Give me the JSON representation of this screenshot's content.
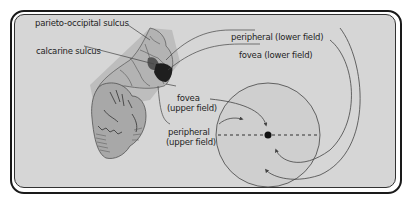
{
  "diagram": {
    "type": "anatomy-visual-field-mapping",
    "labels": {
      "parieto_occipital": "parieto-occipital sulcus",
      "calcarine": "calcarine sulcus",
      "peripheral_lower": "peripheral (lower field)",
      "fovea_lower": "fovea (lower field)",
      "fovea_upper_1": "fovea",
      "fovea_upper_2": "(upper field)",
      "peripheral_upper_1": "peripheral",
      "peripheral_upper_2": "(upper field)"
    },
    "colors": {
      "background": "#d6d6d6",
      "frame": "#1a1a1a",
      "brain_fill": "#a8a8a8",
      "lobe_shade": "#bdbdbd",
      "fovea_dark": "#1e1e1e",
      "peripheral_mid": "#555555",
      "visual_field_fill": "#cfcfcf",
      "line": "#444444"
    }
  }
}
